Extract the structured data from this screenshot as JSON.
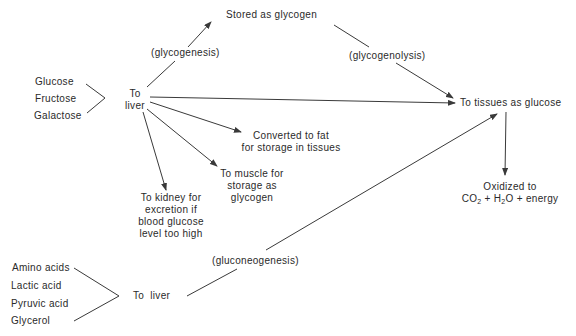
{
  "diagram": {
    "sugars": [
      "Glucose",
      "Fructose",
      "Galactose"
    ],
    "liver_top": [
      "To",
      "liver"
    ],
    "stored_glycogen": "Stored as glycogen",
    "glycogenesis": "(glycogenesis)",
    "glycogenolysis": "(glycogenolysis)",
    "tissues": "To tissues as glucose",
    "fat": [
      "Converted to fat",
      "for storage in tissues"
    ],
    "muscle": [
      "To muscle for",
      "storage as",
      "glycogen"
    ],
    "kidney": [
      "To kidney for",
      "excretion if",
      "blood glucose",
      "level too high"
    ],
    "oxidized": "Oxidized to",
    "oxidized_formula": {
      "co": "CO",
      "two": "2",
      "plus1": " + ",
      "h": "H",
      "h2": "2",
      "o": "O",
      "plus2": " + energy"
    },
    "gluconeogenesis": "(gluconeogenesis)",
    "precursors": [
      "Amino acids",
      "Lactic acid",
      "Pyruvic acid",
      "Glycerol"
    ],
    "liver_bottom": "To  liver",
    "colors": {
      "line": "#3a3a3a",
      "text": "#2a2a2a"
    }
  }
}
